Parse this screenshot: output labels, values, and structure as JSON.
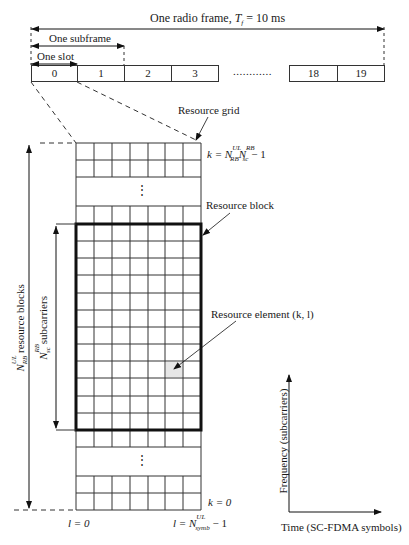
{
  "frame": {
    "title_prefix": "One radio frame, ",
    "title_symbol": "T",
    "title_sub": "f",
    "title_suffix": " = 10 ms",
    "subframe_label": "One subframe",
    "slot_label": "One slot",
    "slots": [
      "0",
      "1",
      "2",
      "3",
      "18",
      "19"
    ],
    "ellipsis": "............"
  },
  "grid": {
    "resource_grid_label": "Resource grid",
    "resource_block_label": "Resource block",
    "resource_element_label": "Resource element (k, l)",
    "vdots": "⋮",
    "k_top": {
      "prefix": "k = N",
      "sub1": "RB",
      "sup1": "UL",
      "mid": "N",
      "sub2": "sc",
      "sup2": "RB",
      "suffix": " − 1"
    },
    "k_bottom": "k = 0",
    "l_left": "l = 0",
    "l_right": {
      "prefix": "l = N",
      "sub": "symb",
      "sup": "UL",
      "suffix": " − 1"
    },
    "columns": 7,
    "highlight_color": "#e6e6e6"
  },
  "left_labels": {
    "outer": {
      "sym": "N",
      "sub": "RB",
      "sup": "UL",
      "text": " resource blocks"
    },
    "inner": {
      "sym": "N",
      "sub": "sc",
      "sup": "RB",
      "text": " subcarriers"
    }
  },
  "axes": {
    "y_label": "Frequency (subcarriers)",
    "x_label": "Time (SC-FDMA symbols)"
  }
}
